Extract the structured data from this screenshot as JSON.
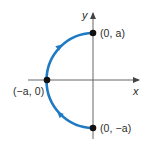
{
  "figure": {
    "axes": {
      "x_label": "x",
      "y_label": "y"
    },
    "points": [
      {
        "id": "top",
        "label": "(0, a)"
      },
      {
        "id": "left",
        "label": "(−a, 0)"
      },
      {
        "id": "bottom",
        "label": "(0, −a)"
      }
    ],
    "curve_color": "#1f7ac4",
    "axis_color": "#555555",
    "point_color": "#111111"
  }
}
